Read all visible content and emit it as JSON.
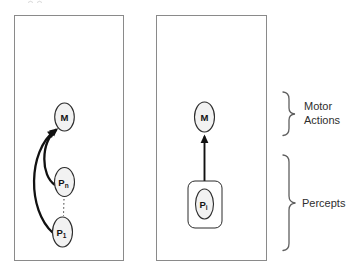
{
  "figure": {
    "left_panel": {
      "nodes": {
        "m": {
          "label": "M"
        },
        "pn": {
          "main": "P",
          "sub": "n"
        },
        "p1": {
          "main": "P",
          "sub": "1"
        }
      }
    },
    "right_panel": {
      "nodes": {
        "m": {
          "label": "M"
        },
        "pi": {
          "main": "P",
          "sub": "i"
        }
      }
    },
    "annotations": {
      "motor_line1": "Motor",
      "motor_line2": "Actions",
      "percepts": "Percepts"
    },
    "colors": {
      "panel_border": "#8a8a8a",
      "node_fill": "#f2f2f2",
      "node_stroke": "#2b2b2b",
      "arrow": "#111111",
      "brace": "#5f5f5f",
      "text": "#2e2e2e"
    }
  }
}
